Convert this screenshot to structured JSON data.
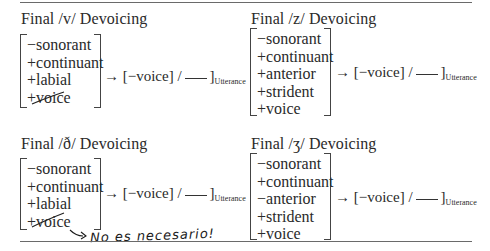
{
  "panels": [
    {
      "title": "Final /v/ Devoicing",
      "features": [
        "−sonorant",
        "+continuant",
        "+labial",
        "+voice"
      ],
      "struck_feature": "+voice",
      "rule": {
        "arrow": "→",
        "change": "[−voice]",
        "slash": "/",
        "boundary": "]",
        "environment": "Utterance"
      }
    },
    {
      "title": "Final /z/ Devoicing",
      "features": [
        "−sonorant",
        "+continuant",
        "+anterior",
        "+strident",
        "+voice"
      ],
      "rule": {
        "arrow": "→",
        "change": "[−voice]",
        "slash": "/",
        "boundary": "]",
        "environment": "Utterance"
      }
    },
    {
      "title": "Final /ð/ Devoicing",
      "features": [
        "−sonorant",
        "+continuant",
        "+labial",
        "+voice"
      ],
      "struck_feature": "+voice",
      "rule": {
        "arrow": "→",
        "change": "[−voice]",
        "slash": "/",
        "boundary": "]",
        "environment": "Utterance"
      }
    },
    {
      "title": "Final /ʒ/ Devoicing",
      "features": [
        "−sonorant",
        "+continuant",
        "−anterior",
        "+strident",
        "+voice"
      ],
      "rule": {
        "arrow": "→",
        "change": "[−voice]",
        "slash": "/",
        "boundary": "]",
        "environment": "Utterance"
      }
    }
  ],
  "annotation": {
    "arrow": "↪",
    "text": "No es necesario!"
  }
}
